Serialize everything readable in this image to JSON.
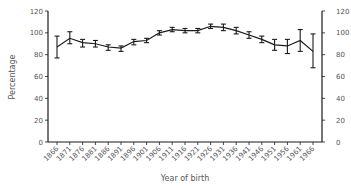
{
  "chart_data": {
    "type": "line",
    "title": "",
    "xlabel": "Year of birth",
    "ylabel": "Percentage",
    "ylim": [
      0,
      120
    ],
    "yticks": [
      0,
      20,
      40,
      60,
      80,
      100,
      120
    ],
    "right_axis_ticks": [
      0,
      20,
      40,
      60,
      80,
      100,
      120
    ],
    "grid": false,
    "legend": null,
    "error_bars": true,
    "categories": [
      "1866",
      "1871",
      "1876",
      "1881",
      "1886",
      "1891",
      "1896",
      "1901",
      "1906",
      "1911",
      "1916",
      "1921",
      "1926",
      "1931",
      "1936",
      "1941",
      "1946",
      "1951",
      "1956",
      "1961",
      "1966"
    ],
    "series": [
      {
        "name": "Percentage",
        "values": [
          87,
          95,
          91,
          90,
          87,
          86,
          92,
          93,
          100,
          103,
          102,
          102,
          106,
          105,
          102,
          98,
          94,
          89,
          88,
          93,
          83
        ],
        "lower": [
          77,
          90,
          87,
          87,
          84,
          83,
          89,
          91,
          98,
          101,
          100,
          100,
          104,
          102,
          99,
          95,
          91,
          84,
          81,
          83,
          68
        ],
        "upper": [
          97,
          101,
          94,
          93,
          89,
          88,
          94,
          95,
          102,
          105,
          104,
          104,
          108,
          108,
          105,
          101,
          97,
          94,
          94,
          103,
          99
        ]
      }
    ]
  },
  "colors": {
    "line": "#1a1a1a",
    "axis": "#1a1a1a",
    "text": "#555555"
  }
}
